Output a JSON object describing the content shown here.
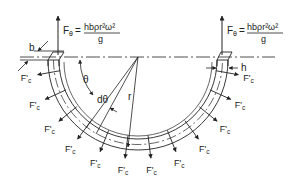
{
  "diagram": {
    "labels": {
      "force_symbol": "F",
      "force_subscript": "θ",
      "equals": "=",
      "numerator": "hbρr²ω²",
      "denominator": "g",
      "width": "b",
      "height": "h",
      "angle": "θ",
      "increment": "dθ",
      "radius": "r",
      "radial_force": "F'",
      "radial_force_subscript": "c"
    },
    "radial_force_count": 12,
    "colors": {
      "line": "#222222",
      "background": "#ffffff"
    }
  }
}
